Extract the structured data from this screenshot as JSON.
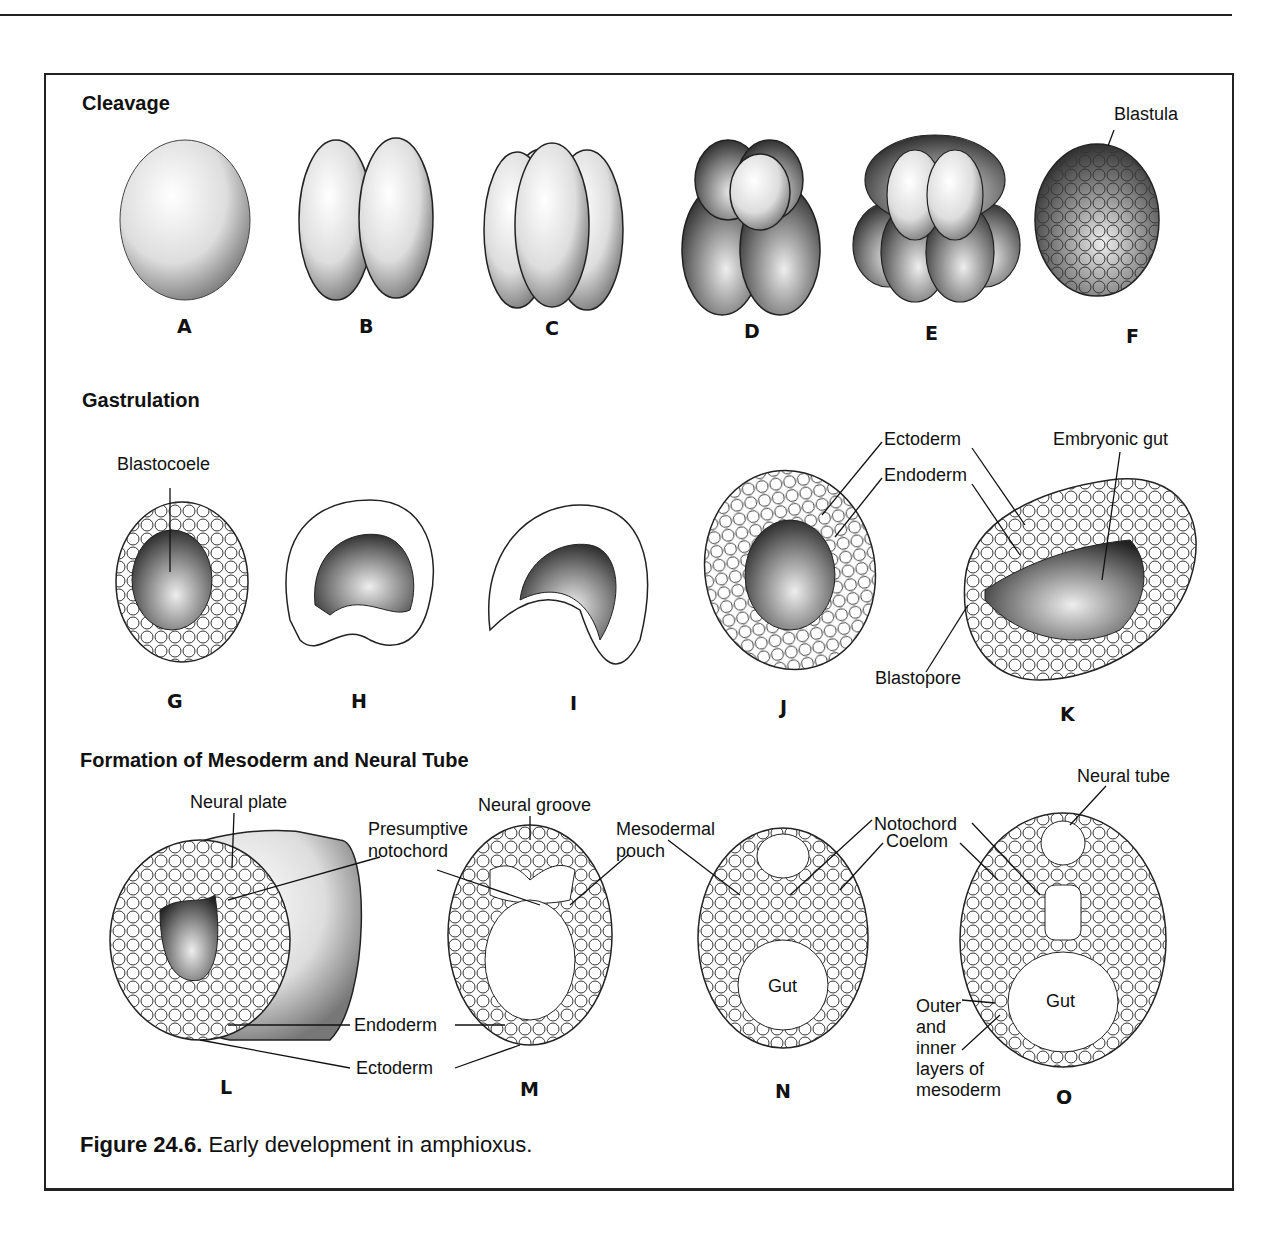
{
  "page_header": {
    "running_title": "Development",
    "page_number": "213"
  },
  "sections": [
    {
      "id": "cleavage",
      "title": "Cleavage",
      "stages": [
        {
          "label": "A"
        },
        {
          "label": "B"
        },
        {
          "label": "C"
        },
        {
          "label": "D"
        },
        {
          "label": "E"
        },
        {
          "label": "F",
          "annotation": "Blastula"
        }
      ]
    },
    {
      "id": "gastrulation",
      "title": "Gastrulation",
      "stages": [
        {
          "label": "G",
          "annotation": "Blastocoele"
        },
        {
          "label": "H"
        },
        {
          "label": "I"
        },
        {
          "label": "J"
        },
        {
          "label": "K"
        }
      ],
      "annotations": [
        "Ectoderm",
        "Endoderm",
        "Embryonic gut",
        "Blastopore"
      ]
    },
    {
      "id": "mesoderm",
      "title": "Formation of Mesoderm and Neural Tube",
      "stages": [
        {
          "label": "L"
        },
        {
          "label": "M"
        },
        {
          "label": "N"
        },
        {
          "label": "O"
        }
      ],
      "annotations": {
        "neural_plate": "Neural plate",
        "presumptive_1": "Presumptive",
        "presumptive_2": "notochord",
        "neural_groove": "Neural groove",
        "mesodermal_1": "Mesodermal",
        "mesodermal_2": "pouch",
        "notochord": "Notochord",
        "coelom": "Coelom",
        "neural_tube": "Neural tube",
        "endoderm": "Endoderm",
        "ectoderm": "Ectoderm",
        "gut_n": "Gut",
        "gut_o": "Gut",
        "outer_1": "Outer",
        "outer_2": "and",
        "outer_3": "inner",
        "outer_4": "layers of",
        "outer_5": "mesoderm"
      }
    }
  ],
  "caption": {
    "number": "Figure 24.6.",
    "text": "Early development in amphioxus."
  }
}
